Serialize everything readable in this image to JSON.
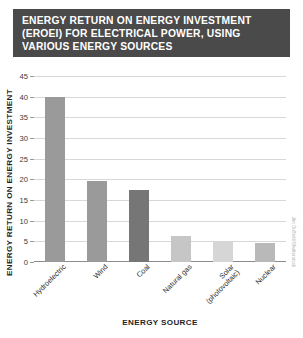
{
  "title": {
    "lines": [
      "ENERGY RETURN ON ENERGY INVESTMENT",
      "(EROEI) FOR ELECTRICAL POWER, USING",
      "VARIOUS ENERGY SOURCES"
    ],
    "background_color": "#4a4a4a",
    "text_color": "#ffffff"
  },
  "credit": "Jim Duffield/Shutterstock",
  "chart_data": {
    "type": "bar",
    "title": "ENERGY RETURN ON ENERGY INVESTMENT (EROEI) FOR ELECTRICAL POWER, USING VARIOUS ENERGY SOURCES",
    "xlabel": "ENERGY SOURCE",
    "ylabel": "ENERGY RETURN ON ENERGY INVESTMENT",
    "categories": [
      "Hydroelectric",
      "Wind",
      "Coal",
      "Natural gas",
      "Solar (photovoltaic)",
      "Nuclear"
    ],
    "category_label_lines": [
      [
        "Hydroelectric"
      ],
      [
        "Wind"
      ],
      [
        "Coal"
      ],
      [
        "Natural gas"
      ],
      [
        "Solar",
        "(photovoltaic)"
      ],
      [
        "Nuclear"
      ]
    ],
    "values": [
      40,
      19.5,
      17.5,
      6.3,
      5,
      4.5
    ],
    "bar_colors": [
      "#9a9a9a",
      "#9a9a9a",
      "#767676",
      "#c6c6c6",
      "#d6d6d6",
      "#b9b9b9"
    ],
    "ylim": [
      0,
      45
    ],
    "yticks": [
      0,
      5,
      10,
      15,
      20,
      25,
      30,
      35,
      40,
      45
    ],
    "ytick_labels": [
      "0",
      "5",
      "10",
      "15",
      "20",
      "25",
      "30",
      "35",
      "40",
      "45"
    ],
    "grid": true,
    "grid_color": "#d8d8d8",
    "axis_color": "#8c8c8c",
    "legend": null
  }
}
